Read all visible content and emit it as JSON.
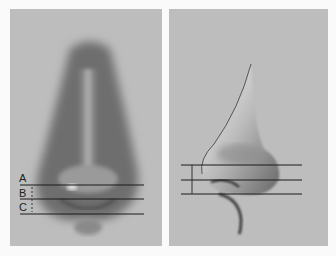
{
  "figure": {
    "left_panel": {
      "view": "front",
      "labels": [
        "A",
        "B",
        "C"
      ],
      "line_y": [
        176,
        190,
        205
      ]
    },
    "right_panel": {
      "view": "profile",
      "line_y": [
        156,
        171,
        185
      ]
    },
    "colors": {
      "background": "#bdbdbd",
      "line": "#1a1a1a",
      "page": "#fafafa"
    }
  }
}
